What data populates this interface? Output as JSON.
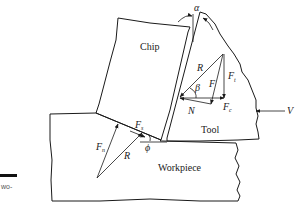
{
  "diagram": {
    "regions": {
      "chip": "Chip",
      "tool": "Tool",
      "workpiece": "Workpiece"
    },
    "force_labels": {
      "R_tool": "R",
      "F": "F",
      "Ft_main": "F",
      "Ft_sub": "t",
      "Fc_main": "F",
      "Fc_sub": "c",
      "N": "N",
      "beta": "β",
      "alpha": "α",
      "V": "V",
      "Fs_main": "F",
      "Fs_sub": "s",
      "Fn_main": "F",
      "Fn_sub": "n",
      "R_shear": "R",
      "phi": "ϕ"
    },
    "caption_fragment": "wo-",
    "colors": {
      "line": "#1a1a1a",
      "background": "#ffffff",
      "caption_bar": "#111111"
    }
  }
}
